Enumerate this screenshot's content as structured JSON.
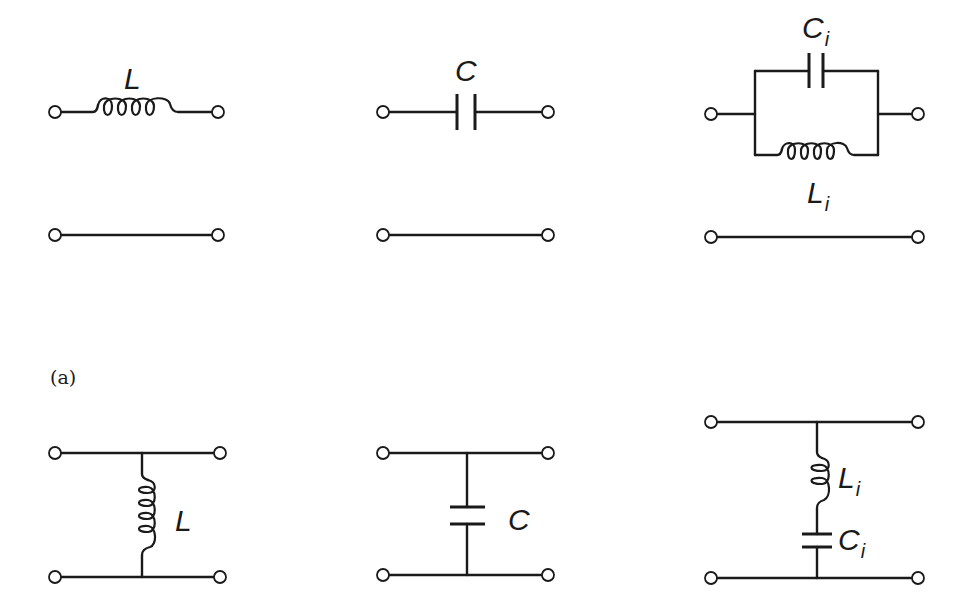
{
  "figure": {
    "panel_label": "(a)",
    "colors": {
      "ink": "#1a1a1a",
      "background": "#ffffff"
    },
    "rows": [
      {
        "name": "series-elements",
        "circuits": [
          {
            "type": "series-inductor",
            "labels": [
              {
                "main": "L",
                "sub": ""
              }
            ]
          },
          {
            "type": "series-capacitor",
            "labels": [
              {
                "main": "C",
                "sub": ""
              }
            ]
          },
          {
            "type": "parallel-LC-in-series-arm",
            "labels": [
              {
                "main": "C",
                "sub": "i"
              },
              {
                "main": "L",
                "sub": "i"
              }
            ]
          }
        ]
      },
      {
        "name": "shunt-elements",
        "circuits": [
          {
            "type": "shunt-inductor",
            "labels": [
              {
                "main": "L",
                "sub": ""
              }
            ]
          },
          {
            "type": "shunt-capacitor",
            "labels": [
              {
                "main": "C",
                "sub": ""
              }
            ]
          },
          {
            "type": "series-LC-in-shunt-arm",
            "labels": [
              {
                "main": "L",
                "sub": "i"
              },
              {
                "main": "C",
                "sub": "i"
              }
            ]
          }
        ]
      }
    ]
  }
}
